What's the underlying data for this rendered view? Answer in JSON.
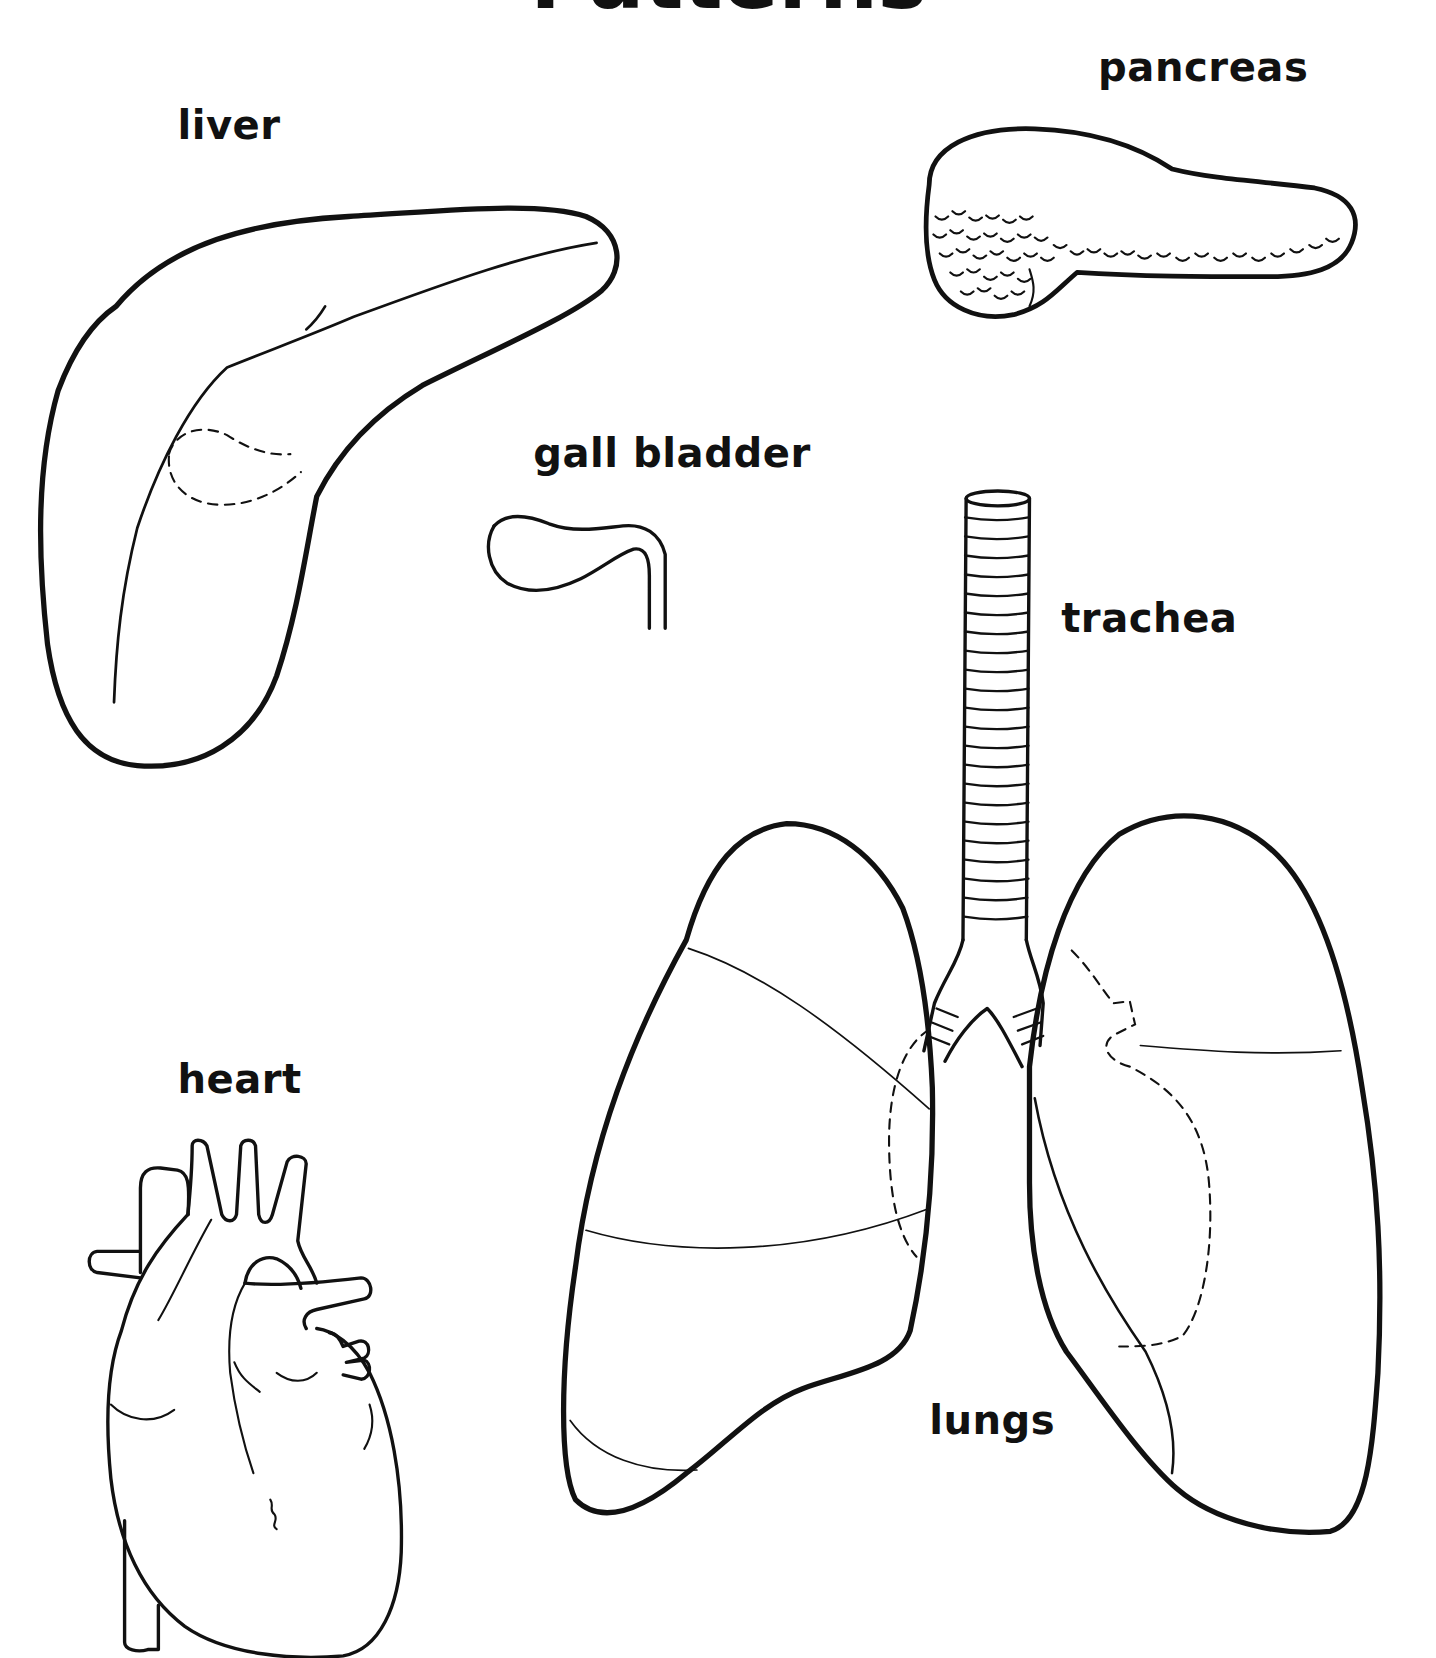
{
  "title": "Patterns",
  "labels": {
    "liver": "liver",
    "pancreas": "pancreas",
    "gall_bladder": "gall bladder",
    "trachea": "trachea",
    "heart": "heart",
    "lungs": "lungs"
  },
  "colors": {
    "ink": "#111111",
    "paper": "#ffffff"
  }
}
